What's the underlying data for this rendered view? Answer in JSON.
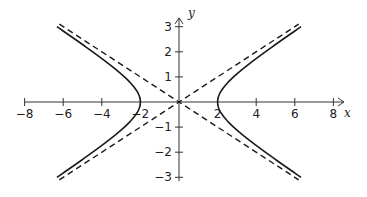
{
  "chart_data": {
    "type": "line",
    "title": "",
    "xlabel": "x",
    "ylabel": "y",
    "xlim": [
      -8.2,
      8.6
    ],
    "ylim": [
      -3.2,
      3.4
    ],
    "grid": false,
    "legend": null,
    "x_ticks": [
      -8,
      -6,
      -4,
      -2,
      2,
      4,
      6,
      8
    ],
    "x_tick_labels": [
      "−8",
      "−6",
      "−4",
      "−2",
      "2",
      "4",
      "6",
      "8"
    ],
    "y_ticks": [
      3,
      2,
      1,
      -1,
      -2,
      -3
    ],
    "y_tick_labels": [
      "3",
      "2",
      "1",
      "−1",
      "−2",
      "−3"
    ],
    "series": [
      {
        "name": "hyperbola",
        "equation": "x^2/4 - y^2 = 1",
        "style": "solid",
        "color": "#1a1a1a",
        "branches": [
          {
            "side": "right",
            "vertex": [
              2,
              0
            ],
            "y_range": [
              -3,
              3
            ]
          },
          {
            "side": "left",
            "vertex": [
              -2,
              0
            ],
            "y_range": [
              -3,
              3
            ]
          }
        ]
      },
      {
        "name": "asymptote y = x/2",
        "style": "dashed",
        "color": "#1a1a1a",
        "points": [
          [
            -6.2,
            -3.1
          ],
          [
            6.2,
            3.1
          ]
        ]
      },
      {
        "name": "asymptote y = -x/2",
        "style": "dashed",
        "color": "#1a1a1a",
        "points": [
          [
            -6.2,
            3.1
          ],
          [
            6.2,
            -3.1
          ]
        ]
      }
    ]
  },
  "axes": {
    "x_label": "x",
    "y_label": "y"
  }
}
